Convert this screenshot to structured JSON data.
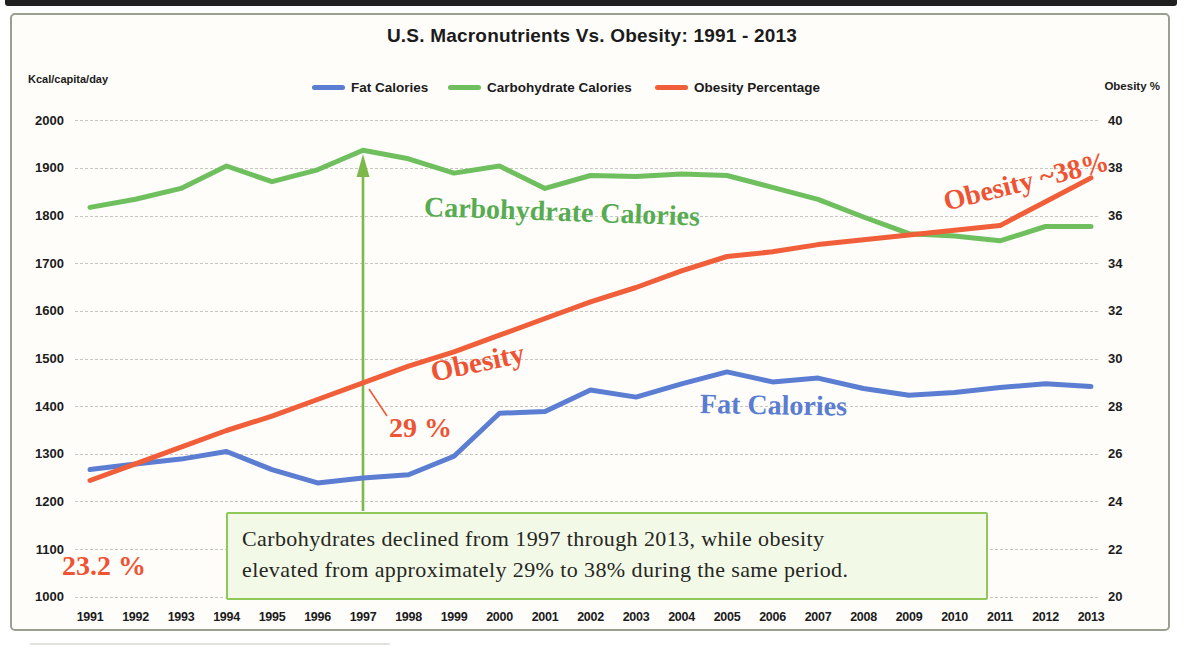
{
  "chart_data": {
    "type": "line",
    "title": "U.S. Macronutrients Vs. Obesity: 1991 - 2013",
    "ylabel_left": "Kcal/capita/day",
    "ylabel_right": "Obesity %",
    "ylim_left": [
      1000,
      2000
    ],
    "ylim_right": [
      20,
      40
    ],
    "grid": true,
    "legend_position": "top",
    "left_ticks": [
      "2000",
      "1900",
      "1800",
      "1700",
      "1600",
      "1500",
      "1400",
      "1300",
      "1200",
      "1100",
      "1000"
    ],
    "right_ticks": [
      "40",
      "38",
      "36",
      "34",
      "32",
      "30",
      "28",
      "26",
      "24",
      "22",
      "20"
    ],
    "x_ticks": [
      "1991",
      "1992",
      "1993",
      "1994",
      "1995",
      "1996",
      "1997",
      "1998",
      "1999",
      "2000",
      "2001",
      "2002",
      "2003",
      "2004",
      "2005",
      "2006",
      "2007",
      "2008",
      "2009",
      "2010",
      "2011",
      "2012",
      "2013"
    ],
    "series": [
      {
        "name": "Fat Calories",
        "color": "#5b7ed2",
        "axis": "left",
        "values": [
          1268,
          1280,
          1290,
          1306,
          1268,
          1240,
          1250,
          1257,
          1296,
          1386,
          1390,
          1435,
          1420,
          1448,
          1473,
          1452,
          1460,
          1438,
          1424,
          1430,
          1440,
          1448,
          1442
        ]
      },
      {
        "name": "Carbohydrate Calories",
        "color": "#6fbf5f",
        "axis": "left",
        "values": [
          1818,
          1835,
          1858,
          1905,
          1872,
          1897,
          1938,
          1920,
          1890,
          1905,
          1858,
          1885,
          1883,
          1888,
          1885,
          1860,
          1835,
          1798,
          1763,
          1758,
          1748,
          1778,
          1778
        ]
      },
      {
        "name": "Obesity Percentage",
        "color": "#f05f39",
        "axis": "right",
        "values": [
          24.9,
          25.6,
          26.3,
          27.0,
          27.6,
          28.3,
          29.0,
          29.7,
          30.3,
          31.0,
          31.7,
          32.4,
          33.0,
          33.7,
          34.3,
          34.5,
          34.8,
          35.0,
          35.2,
          35.4,
          35.6,
          36.6,
          37.6
        ]
      }
    ],
    "annotations": {
      "box_line1": "Carbohydrates declined from 1997 through 2013, while obesity",
      "box_line2": "elevated from approximately 29% to 38% during the same period.",
      "start_value_label": "23.2 %",
      "arrow_value_label": "29 %",
      "obesity_mid_label": "Obesity",
      "obesity_end_label": "Obesity ~38%",
      "carb_line_label": "Carbohydrate Calories",
      "fat_line_label": "Fat Calories",
      "arrow_year": "1997"
    }
  }
}
